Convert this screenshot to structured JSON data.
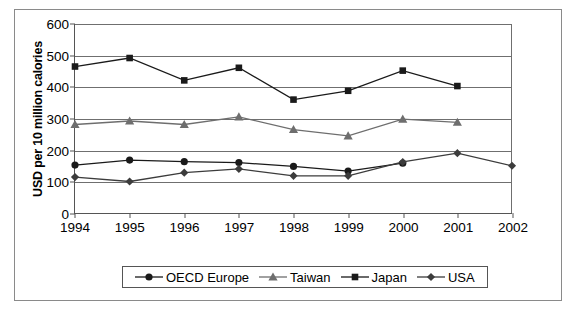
{
  "chart_data": {
    "type": "line",
    "title": "",
    "xlabel": "",
    "ylabel": "USD per 10 million calories",
    "x": [
      1994,
      1995,
      1996,
      1997,
      1998,
      1999,
      2000,
      2001,
      2002
    ],
    "xtick_labels": [
      "1994",
      "1995",
      "1996",
      "1997",
      "1998",
      "1999",
      "2000",
      "2001",
      "2002"
    ],
    "ytick_labels": [
      "0",
      "100",
      "200",
      "300",
      "400",
      "500",
      "600"
    ],
    "yticks": [
      0,
      100,
      200,
      300,
      400,
      500,
      600
    ],
    "ylim": [
      0,
      600
    ],
    "xlim": [
      1994,
      2002
    ],
    "grid": true,
    "legend_position": "bottom",
    "series": [
      {
        "name": "OECD Europe",
        "marker": "circle",
        "color": "#1a1a1a",
        "x": [
          1994,
          1995,
          1996,
          1997,
          1998,
          1999,
          2000
        ],
        "values": [
          152,
          168,
          163,
          160,
          148,
          133,
          158
        ]
      },
      {
        "name": "Taiwan",
        "marker": "triangle",
        "color": "#6e6e6e",
        "x": [
          1994,
          1995,
          1996,
          1997,
          1998,
          1999,
          2000,
          2001
        ],
        "values": [
          281,
          292,
          281,
          305,
          265,
          245,
          298,
          288
        ]
      },
      {
        "name": "Japan",
        "marker": "square",
        "color": "#1a1a1a",
        "x": [
          1994,
          1995,
          1996,
          1997,
          1998,
          1999,
          2000,
          2001
        ],
        "values": [
          465,
          492,
          421,
          461,
          360,
          388,
          452,
          403
        ]
      },
      {
        "name": "USA",
        "marker": "diamond",
        "color": "#3c3c3c",
        "x": [
          1994,
          1995,
          1996,
          1997,
          1998,
          1999,
          2000,
          2001,
          2002
        ],
        "values": [
          114,
          100,
          128,
          140,
          118,
          118,
          162,
          190,
          150
        ]
      }
    ]
  },
  "legend": {
    "items": [
      {
        "label": "OECD Europe",
        "marker": "circle"
      },
      {
        "label": "Taiwan",
        "marker": "triangle"
      },
      {
        "label": "Japan",
        "marker": "square"
      },
      {
        "label": "USA",
        "marker": "diamond"
      }
    ]
  }
}
